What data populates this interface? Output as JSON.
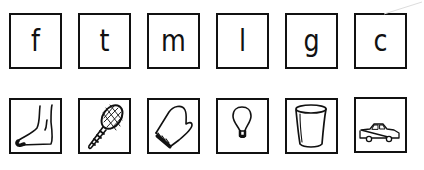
{
  "worksheet": {
    "letters": [
      {
        "char": "f"
      },
      {
        "char": "t"
      },
      {
        "char": "m"
      },
      {
        "char": "l"
      },
      {
        "char": "g"
      },
      {
        "char": "c"
      }
    ],
    "pictures": [
      {
        "icon": "foot-icon",
        "label": "foot"
      },
      {
        "icon": "tennis-racket-icon",
        "label": "racket"
      },
      {
        "icon": "mitten-icon",
        "label": "mitten"
      },
      {
        "icon": "lightbulb-icon",
        "label": "lightbulb"
      },
      {
        "icon": "can-icon",
        "label": "can"
      },
      {
        "icon": "car-icon",
        "label": "car"
      }
    ],
    "colors": {
      "ink": "#111111",
      "paper": "#ffffff"
    }
  }
}
